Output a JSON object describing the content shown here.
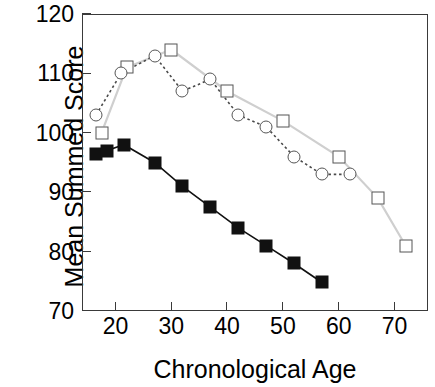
{
  "chart_data": {
    "type": "line",
    "title": "",
    "xlabel": "Chronological Age",
    "ylabel": "Mean Summed Score",
    "xlim": [
      14,
      76
    ],
    "ylim": [
      70,
      120
    ],
    "xticks": [
      20,
      30,
      40,
      50,
      60,
      70
    ],
    "yticks": [
      70,
      80,
      90,
      100,
      110,
      120
    ],
    "grid": false,
    "legend": "none",
    "series": [
      {
        "name": "open-squares",
        "marker": "open-square",
        "line": "solid",
        "color": "#bbbbbb",
        "points": [
          {
            "x": 17.5,
            "y": 100
          },
          {
            "x": 22,
            "y": 111
          },
          {
            "x": 30,
            "y": 114
          },
          {
            "x": 40,
            "y": 107
          },
          {
            "x": 50,
            "y": 102
          },
          {
            "x": 60,
            "y": 96
          },
          {
            "x": 67,
            "y": 89
          },
          {
            "x": 72,
            "y": 81
          }
        ]
      },
      {
        "name": "open-circles",
        "marker": "open-circle",
        "line": "dotted",
        "color": "#555555",
        "points": [
          {
            "x": 16.5,
            "y": 103
          },
          {
            "x": 21,
            "y": 110
          },
          {
            "x": 27,
            "y": 113
          },
          {
            "x": 32,
            "y": 107
          },
          {
            "x": 37,
            "y": 109
          },
          {
            "x": 42,
            "y": 103
          },
          {
            "x": 47,
            "y": 101
          },
          {
            "x": 52,
            "y": 96
          },
          {
            "x": 57,
            "y": 93
          },
          {
            "x": 62,
            "y": 93
          }
        ]
      },
      {
        "name": "filled-squares",
        "marker": "filled-square",
        "line": "solid",
        "color": "#111111",
        "points": [
          {
            "x": 16.5,
            "y": 96.5
          },
          {
            "x": 18.5,
            "y": 97
          },
          {
            "x": 21.5,
            "y": 98
          },
          {
            "x": 27,
            "y": 95
          },
          {
            "x": 32,
            "y": 91
          },
          {
            "x": 37,
            "y": 87.5
          },
          {
            "x": 42,
            "y": 84
          },
          {
            "x": 47,
            "y": 81
          },
          {
            "x": 52,
            "y": 78
          },
          {
            "x": 57,
            "y": 74.8
          }
        ]
      }
    ]
  }
}
